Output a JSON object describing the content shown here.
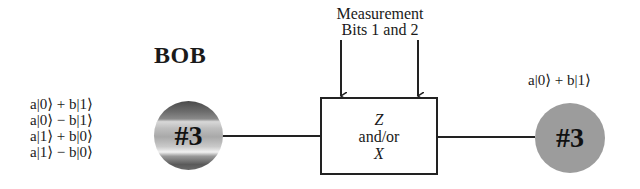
{
  "diagram": {
    "title": "BOB",
    "possible_states": [
      "a|0⟩ + b|1⟩",
      "a|0⟩ − b|1⟩",
      "a|1⟩ + b|0⟩",
      "a|1⟩ − b|0⟩"
    ],
    "input_qubit": {
      "label": "#3"
    },
    "measurement_caption": {
      "line1": "Measurement",
      "line2": "Bits 1 and 2"
    },
    "gate_box": {
      "line1": "Z",
      "line2": "and/or",
      "line3": "X"
    },
    "output_qubit": {
      "label": "#3",
      "state": "a|0⟩ + b|1⟩"
    },
    "colors": {
      "line": "#222222",
      "output_qubit_fill": "#9c9c9c",
      "background": "#ffffff"
    }
  }
}
